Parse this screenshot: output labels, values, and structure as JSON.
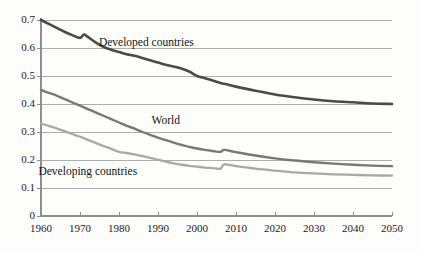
{
  "chart_data": {
    "type": "line",
    "title": "",
    "subtitle": "",
    "xlabel": "",
    "ylabel": "",
    "xlim": [
      1960,
      2050
    ],
    "ylim": [
      0,
      0.7
    ],
    "grid": true,
    "grid_axis": "y",
    "legend_position": "inline-annotations",
    "xticks": [
      1960,
      1970,
      1980,
      1990,
      2000,
      2010,
      2020,
      2030,
      2040,
      2050
    ],
    "xtick_labels": [
      "1960",
      "1970",
      "1980",
      "1990",
      "2000",
      "2010",
      "2020",
      "2030",
      "2040",
      "2050"
    ],
    "yticks": [
      0,
      0.1,
      0.2,
      0.3,
      0.4,
      0.5,
      0.6,
      0.7
    ],
    "ytick_labels": [
      "0",
      "0.1",
      "0.2",
      "0.3",
      "0.4",
      "0.5",
      "0.6",
      "0.7"
    ],
    "annotations": [
      {
        "text": "Developed countries",
        "x": 1987,
        "y": 0.615
      },
      {
        "text": "World",
        "x": 1992,
        "y": 0.335
      },
      {
        "text": "Developing countries",
        "x": 1972,
        "y": 0.155
      }
    ],
    "series": [
      {
        "name": "Developed countries",
        "color": "#4a4a4a",
        "width": 2.6,
        "x": [
          1960,
          1962,
          1964,
          1966,
          1968,
          1970,
          1971,
          1972,
          1974,
          1976,
          1978,
          1980,
          1982,
          1984,
          1986,
          1988,
          1990,
          1992,
          1994,
          1996,
          1998,
          2000,
          2002,
          2004,
          2006,
          2007,
          2010,
          2015,
          2020,
          2025,
          2030,
          2035,
          2040,
          2045,
          2050
        ],
        "y": [
          0.7,
          0.686,
          0.672,
          0.658,
          0.646,
          0.636,
          0.648,
          0.64,
          0.62,
          0.604,
          0.594,
          0.586,
          0.578,
          0.572,
          0.564,
          0.556,
          0.548,
          0.54,
          0.534,
          0.527,
          0.516,
          0.5,
          0.492,
          0.484,
          0.475,
          0.472,
          0.462,
          0.447,
          0.434,
          0.424,
          0.416,
          0.41,
          0.406,
          0.402,
          0.4
        ]
      },
      {
        "name": "World",
        "color": "#787878",
        "width": 2.4,
        "x": [
          1960,
          1962,
          1964,
          1966,
          1968,
          1970,
          1972,
          1974,
          1976,
          1978,
          1980,
          1982,
          1984,
          1986,
          1988,
          1990,
          1992,
          1994,
          1996,
          1998,
          2000,
          2002,
          2004,
          2006,
          2007,
          2010,
          2015,
          2020,
          2025,
          2030,
          2035,
          2040,
          2045,
          2050
        ],
        "y": [
          0.45,
          0.44,
          0.43,
          0.418,
          0.406,
          0.394,
          0.382,
          0.37,
          0.358,
          0.346,
          0.334,
          0.322,
          0.312,
          0.3,
          0.29,
          0.28,
          0.271,
          0.262,
          0.254,
          0.247,
          0.241,
          0.236,
          0.232,
          0.229,
          0.236,
          0.228,
          0.216,
          0.206,
          0.198,
          0.192,
          0.187,
          0.183,
          0.18,
          0.178
        ]
      },
      {
        "name": "Developing countries",
        "color": "#a8a8a8",
        "width": 2.3,
        "x": [
          1960,
          1962,
          1964,
          1966,
          1968,
          1970,
          1972,
          1974,
          1976,
          1978,
          1980,
          1982,
          1984,
          1986,
          1988,
          1990,
          1992,
          1994,
          1996,
          1998,
          2000,
          2002,
          2004,
          2006,
          2007,
          2010,
          2015,
          2020,
          2025,
          2030,
          2035,
          2040,
          2045,
          2050
        ],
        "y": [
          0.33,
          0.322,
          0.313,
          0.303,
          0.293,
          0.283,
          0.272,
          0.261,
          0.25,
          0.24,
          0.229,
          0.225,
          0.22,
          0.214,
          0.208,
          0.201,
          0.194,
          0.188,
          0.183,
          0.179,
          0.176,
          0.173,
          0.171,
          0.169,
          0.184,
          0.178,
          0.169,
          0.162,
          0.156,
          0.152,
          0.149,
          0.147,
          0.145,
          0.144
        ]
      }
    ]
  },
  "style": {
    "axis_color": "#8e8e8e",
    "grid_color": "#9a9a9a",
    "text_color": "#1a1a1a",
    "background": "#fdfdfc"
  }
}
